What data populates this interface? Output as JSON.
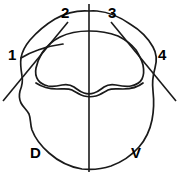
{
  "figure": {
    "type": "line-drawing",
    "width": 179,
    "height": 176,
    "background_color": "#ffffff",
    "stroke_color": "#1a1a1a"
  },
  "labels": {
    "quadrant_1": "1",
    "quadrant_2": "2",
    "quadrant_3": "3",
    "quadrant_4": "4",
    "orientation_dorsal": "D",
    "orientation_ventral": "V"
  },
  "label_positions": {
    "quadrant_1": {
      "x": 8,
      "y": 47
    },
    "quadrant_2": {
      "x": 61,
      "y": 5
    },
    "quadrant_3": {
      "x": 108,
      "y": 5
    },
    "quadrant_4": {
      "x": 158,
      "y": 47
    },
    "orientation_dorsal": {
      "x": 30,
      "y": 145
    },
    "orientation_ventral": {
      "x": 131,
      "y": 145
    }
  },
  "axes": {
    "midline": {
      "name": "vertical-midline",
      "x1": 89,
      "y1": 4,
      "x2": 89,
      "y2": 172
    },
    "diagonal_left": {
      "name": "left-oblique-axis",
      "x1": 3,
      "y1": 101,
      "x2": 68,
      "y2": 22
    },
    "diagonal_right": {
      "name": "right-oblique-axis",
      "x1": 176,
      "y1": 101,
      "x2": 111,
      "y2": 22
    }
  },
  "geometry": {
    "outer_outline": "M 89 11 C 76 10 64 14 55 19 C 45 25 37 32 30 40 C 25 46 22 52 21 58 C 20 64 21 70 22 76 C 23 81 22 86 20 91 C 19 95 19 99 21 103 C 23 107 27 110 29 114 C 31 119 30 124 32 130 C 35 138 41 146 49 153 C 58 161 70 167 82 169 C 92 170 102 169 111 166 C 122 162 132 155 139 147 C 146 139 150 130 152 120 C 154 110 154 100 153 91 C 152 83 153 75 155 68 C 157 61 157 54 153 47 C 148 38 140 30 130 24 C 120 17 108 12 97 11 C 94 10.7 91.5 10.8 89 11 Z",
    "inner_outline": "M 89 31 C 78 31 68 33 60 37 C 52 41 46 47 42 53 C 39 58 37 63 36 68 C 35 73 36 77 38 80 C 40 83 44 85 48 86 C 53 87 58 86 62 85 C 67 84 71 85 74 87 C 77 89 80 92 84 93 C 87 94 91 94 94 93 C 98 92 101 89 104 87 C 107 85 111 84 116 85 C 121 86 126 87 131 86 C 136 85 140 83 142 79 C 144 75 144 70 143 65 C 142 60 139 55 136 50 C 132 45 126 40 118 36 C 110 33 100 31 89 31 Z",
    "inner_ridge": "M 89 31 C 76 31 64 34 55 39 C 47 43 41 49 38 56",
    "lower_lobe": "M 36 83 C 42 87 50 89 57 89 C 63 89 68 88 72 90 C 76 92 80 95 84 96 C 88 97 92 97 96 96 C 100 95 104 92 108 90 C 112 88 117 89 123 89 C 130 89 138 87 143 83"
  }
}
